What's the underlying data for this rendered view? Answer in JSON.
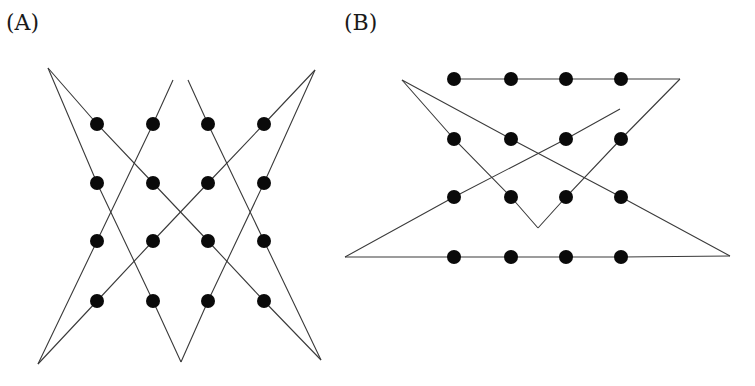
{
  "panels": [
    {
      "id": "A",
      "label": "(A)",
      "grid": {
        "columns_x": [
          97,
          153,
          208,
          264
        ],
        "rows_y": [
          124,
          183,
          241,
          301
        ],
        "dot_radius": 7
      },
      "polylines": [
        [
          [
            48,
            68
          ],
          [
            97,
            124
          ],
          [
            153,
            183
          ],
          [
            208,
            241
          ],
          [
            264,
            301
          ],
          [
            321,
            360
          ]
        ],
        [
          [
            48,
            68
          ],
          [
            97,
            183
          ],
          [
            153,
            301
          ],
          [
            181,
            362
          ]
        ],
        [
          [
            181,
            362
          ],
          [
            208,
            301
          ],
          [
            264,
            183
          ],
          [
            315,
            70
          ]
        ],
        [
          [
            315,
            70
          ],
          [
            264,
            124
          ],
          [
            208,
            183
          ],
          [
            153,
            241
          ],
          [
            97,
            301
          ],
          [
            38,
            364
          ]
        ],
        [
          [
            38,
            364
          ],
          [
            97,
            241
          ],
          [
            153,
            124
          ],
          [
            173,
            80
          ]
        ],
        [
          [
            188,
            80
          ],
          [
            208,
            124
          ],
          [
            264,
            241
          ],
          [
            321,
            360
          ]
        ]
      ]
    },
    {
      "id": "B",
      "label": "(B)",
      "grid": {
        "columns_x": [
          454,
          511,
          566,
          621
        ],
        "rows_y": [
          79,
          139,
          197,
          257
        ],
        "dot_radius": 7
      },
      "polylines": [
        [
          [
            454,
            79
          ],
          [
            511,
            79
          ],
          [
            566,
            79
          ],
          [
            621,
            79
          ],
          [
            680,
            79
          ]
        ],
        [
          [
            680,
            79
          ],
          [
            621,
            139
          ],
          [
            566,
            197
          ],
          [
            538,
            228
          ]
        ],
        [
          [
            538,
            228
          ],
          [
            511,
            197
          ],
          [
            454,
            139
          ],
          [
            402,
            80
          ]
        ],
        [
          [
            402,
            80
          ],
          [
            511,
            139
          ],
          [
            621,
            197
          ],
          [
            730,
            256
          ]
        ],
        [
          [
            730,
            256
          ],
          [
            621,
            257
          ],
          [
            566,
            257
          ],
          [
            511,
            257
          ],
          [
            454,
            257
          ],
          [
            345,
            257
          ]
        ],
        [
          [
            345,
            257
          ],
          [
            454,
            197
          ],
          [
            566,
            139
          ],
          [
            620,
            109
          ]
        ]
      ]
    }
  ]
}
